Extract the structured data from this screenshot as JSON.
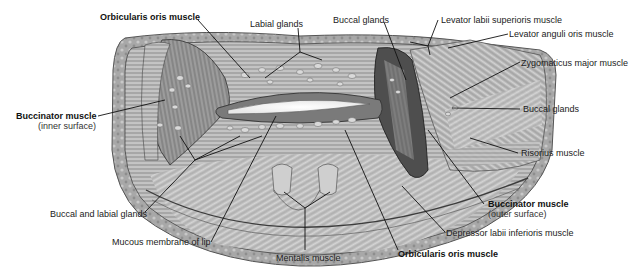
{
  "figure": {
    "type": "anatomical illustration"
  },
  "labels": {
    "orbicularis_top": "Orbicularis oris muscle",
    "labial_glands": "Labial glands",
    "buccal_glands_top": "Buccal glands",
    "levator_labii": "Levator labii superioris muscle",
    "levator_anguli": "Levator anguli oris muscle",
    "zygomaticus": "Zygomaticus major muscle",
    "buccal_glands_right": "Buccal glands",
    "buccinator_inner": "Buccinator muscle",
    "buccinator_inner_sub": "(inner surface)",
    "risorius": "Risorius muscle",
    "buccinator_outer": "Buccinator muscle",
    "buccinator_outer_sub": "(outer surface)",
    "buccal_labial": "Buccal and labial glands",
    "depressor": "Depressor labii inferioris muscle",
    "mucous": "Mucous membrane of lip",
    "mentalis": "Mentalis muscle",
    "orbicularis_bottom": "Orbicularis oris muscle"
  },
  "colors": {
    "tissue_light": "#d8d8d8",
    "tissue_mid": "#a9a9a9",
    "tissue_dark": "#4a4a4a",
    "leader": "#111111"
  }
}
